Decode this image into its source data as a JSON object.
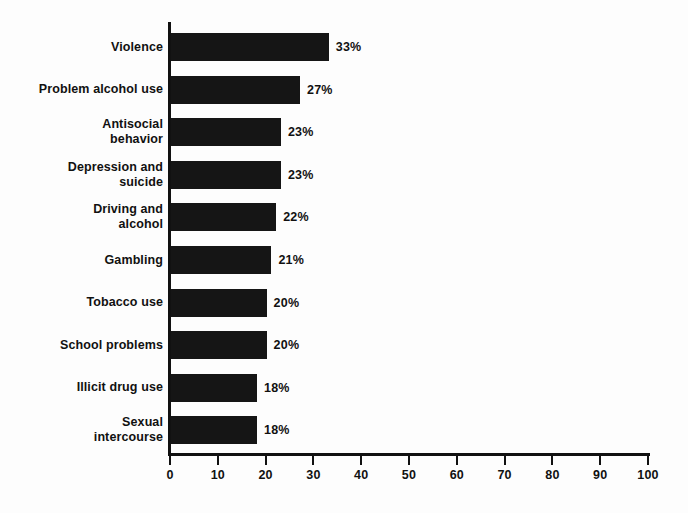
{
  "chart_data": {
    "type": "bar",
    "orientation": "horizontal",
    "title": "",
    "subtitle": "",
    "xlabel": "",
    "ylabel": "",
    "xlim": [
      0,
      100
    ],
    "grid": false,
    "legend": null,
    "value_suffix": "%",
    "categories": [
      "Violence",
      "Problem alcohol use",
      "Antisocial behavior",
      "Depression and suicide",
      "Driving and alcohol",
      "Gambling",
      "Tobacco use",
      "School problems",
      "Illicit drug use",
      "Sexual intercourse"
    ],
    "values": [
      33,
      27,
      23,
      23,
      22,
      21,
      20,
      20,
      18,
      18
    ],
    "data_labels": [
      "33%",
      "27%",
      "23%",
      "23%",
      "22%",
      "21%",
      "20%",
      "20%",
      "18%",
      "18%"
    ],
    "xticks": [
      0,
      10,
      20,
      30,
      40,
      50,
      60,
      70,
      80,
      90,
      100
    ],
    "xtick_labels": [
      "0",
      "10",
      "20",
      "30",
      "40",
      "50",
      "60",
      "70",
      "80",
      "90",
      "100"
    ],
    "colors": {
      "bar": "#151515",
      "axis": "#111111",
      "text": "#111111",
      "background": "#fdfdfd"
    }
  },
  "rows": [
    {
      "label_lines": [
        "Violence"
      ],
      "value": 33,
      "value_label": "33%"
    },
    {
      "label_lines": [
        "Problem alcohol use"
      ],
      "value": 27,
      "value_label": "27%"
    },
    {
      "label_lines": [
        "Antisocial",
        "behavior"
      ],
      "value": 23,
      "value_label": "23%"
    },
    {
      "label_lines": [
        "Depression and",
        "suicide"
      ],
      "value": 23,
      "value_label": "23%"
    },
    {
      "label_lines": [
        "Driving and",
        "alcohol"
      ],
      "value": 22,
      "value_label": "22%"
    },
    {
      "label_lines": [
        "Gambling"
      ],
      "value": 21,
      "value_label": "21%"
    },
    {
      "label_lines": [
        "Tobacco use"
      ],
      "value": 20,
      "value_label": "20%"
    },
    {
      "label_lines": [
        "School problems"
      ],
      "value": 20,
      "value_label": "20%"
    },
    {
      "label_lines": [
        "Illicit drug use"
      ],
      "value": 18,
      "value_label": "18%"
    },
    {
      "label_lines": [
        "Sexual",
        "intercourse"
      ],
      "value": 18,
      "value_label": "18%"
    }
  ]
}
